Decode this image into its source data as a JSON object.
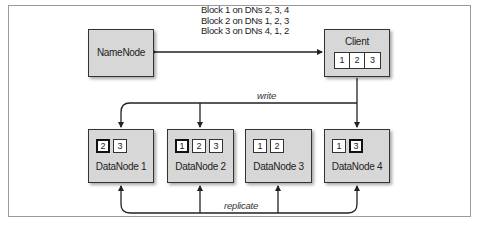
{
  "diagram": {
    "namenode": {
      "label": "NameNode"
    },
    "client": {
      "label": "Client",
      "blocks": [
        "1",
        "2",
        "3"
      ]
    },
    "metadata_lines": [
      "Block 1 on DNs 2, 3, 4",
      "Block 2 on DNs 1, 2, 3",
      "Block 3 on DNs 4, 1, 2"
    ],
    "edges": {
      "write_label": "write",
      "replicate_label": "replicate"
    },
    "datanodes": [
      {
        "label": "DataNode 1",
        "blocks": [
          {
            "id": "2",
            "primary": true
          },
          {
            "id": "3",
            "primary": false
          }
        ]
      },
      {
        "label": "DataNode 2",
        "blocks": [
          {
            "id": "1",
            "primary": true
          },
          {
            "id": "2",
            "primary": false
          },
          {
            "id": "3",
            "primary": false
          }
        ]
      },
      {
        "label": "DataNode 3",
        "blocks": [
          {
            "id": "1",
            "primary": false
          },
          {
            "id": "2",
            "primary": false
          }
        ]
      },
      {
        "label": "DataNode 4",
        "blocks": [
          {
            "id": "1",
            "primary": false
          },
          {
            "id": "3",
            "primary": true
          }
        ]
      }
    ],
    "colors": {
      "node_fill": "#d7d7d7",
      "node_border": "#333333",
      "line": "#222222",
      "frame": "#9a9a9a"
    }
  }
}
